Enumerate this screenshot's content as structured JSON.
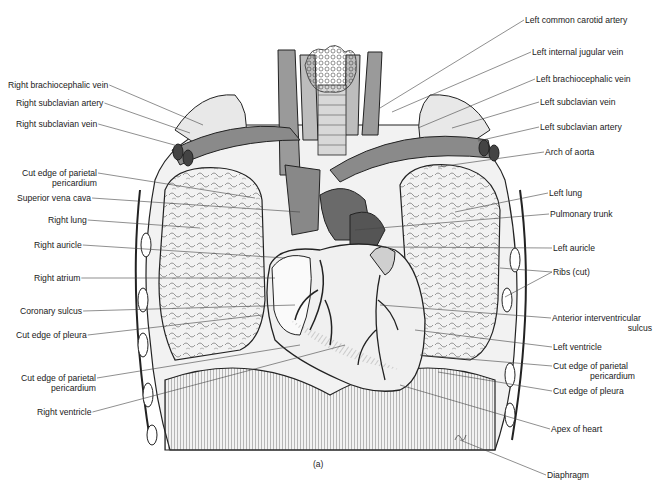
{
  "figure": {
    "caption": "(a)",
    "labels_left": [
      {
        "id": "right-brachiocephalic-vein",
        "text": "Right brachiocephalic vein",
        "x": 8,
        "y": 85,
        "tx": 203,
        "ty": 125
      },
      {
        "id": "right-subclavian-artery",
        "text": "Right subclavian artery",
        "x": 16,
        "y": 103,
        "tx": 190,
        "ty": 133
      },
      {
        "id": "right-subclavian-vein",
        "text": "Right subclavian vein",
        "x": 16,
        "y": 124,
        "tx": 178,
        "ty": 146
      },
      {
        "id": "cut-edge-parietal-pericardium-upper",
        "line1": "Cut edge of parietal",
        "line2": "pericardium",
        "x": 17,
        "y": 171,
        "tx": 255,
        "ty": 198
      },
      {
        "id": "superior-vena-cava",
        "text": "Superior vena cava",
        "x": 17,
        "y": 197,
        "tx": 300,
        "ty": 212
      },
      {
        "id": "right-lung",
        "text": "Right lung",
        "x": 48,
        "y": 219,
        "tx": 200,
        "ty": 228
      },
      {
        "id": "right-auricle",
        "text": "Right auricle",
        "x": 34,
        "y": 243,
        "tx": 285,
        "ty": 258
      },
      {
        "id": "right-atrium",
        "text": "Right atrium",
        "x": 34,
        "y": 272,
        "tx": 275,
        "ty": 278
      },
      {
        "id": "coronary-sulcus",
        "text": "Coronary sulcus",
        "x": 20,
        "y": 306,
        "tx": 295,
        "ty": 305
      },
      {
        "id": "cut-edge-pleura-left-side",
        "text": "Cut edge of pleura",
        "x": 16,
        "y": 330,
        "tx": 262,
        "ty": 315
      },
      {
        "id": "cut-edge-parietal-pericardium-lower",
        "line1": "Cut edge of parietal",
        "line2": "pericardium",
        "x": 16,
        "y": 372,
        "tx": 300,
        "ty": 345
      },
      {
        "id": "right-ventricle",
        "text": "Right ventricle",
        "x": 37,
        "y": 407,
        "tx": 345,
        "ty": 345
      }
    ],
    "labels_right": [
      {
        "id": "left-common-carotid-artery",
        "text": "Left common carotid artery",
        "x": 525,
        "y": 17,
        "tx": 380,
        "ty": 108
      },
      {
        "id": "left-internal-jugular-vein",
        "text": "Left internal jugular vein",
        "x": 532,
        "y": 49,
        "tx": 392,
        "ty": 112
      },
      {
        "id": "left-brachiocephalic-vein",
        "text": "Left brachiocephalic vein",
        "x": 536,
        "y": 76,
        "tx": 418,
        "ty": 128
      },
      {
        "id": "left-subclavian-vein",
        "text": "Left subclavian vein",
        "x": 540,
        "y": 98,
        "tx": 452,
        "ty": 128
      },
      {
        "id": "left-subclavian-artery",
        "text": "Left subclavian artery",
        "x": 540,
        "y": 124,
        "tx": 478,
        "ty": 141
      },
      {
        "id": "arch-of-aorta",
        "text": "Arch of aorta",
        "x": 545,
        "y": 150,
        "tx": 438,
        "ty": 167
      },
      {
        "id": "left-lung",
        "text": "Left lung",
        "x": 549,
        "y": 190,
        "tx": 455,
        "ty": 212
      },
      {
        "id": "pulmonary-trunk",
        "text": "Pulmonary trunk",
        "x": 550,
        "y": 210,
        "tx": 355,
        "ty": 230
      },
      {
        "id": "left-auricle",
        "text": "Left auricle",
        "x": 553,
        "y": 243,
        "tx": 385,
        "ty": 247
      },
      {
        "id": "ribs-cut",
        "text": "Ribs (cut)",
        "x": 553,
        "y": 268,
        "tx": 500,
        "ty": 268,
        "tx2": 505,
        "ty2": 297
      },
      {
        "id": "anterior-interventricular-sulcus",
        "line1": "Anterior interventricular",
        "line2": "sulcus",
        "x": 552,
        "y": 315,
        "tx": 380,
        "ty": 305
      },
      {
        "id": "left-ventricle",
        "text": "Left ventricle",
        "x": 553,
        "y": 343,
        "tx": 415,
        "ty": 330
      },
      {
        "id": "cut-edge-parietal-pericardium-right",
        "line1": "Cut edge of parietal",
        "line2": "pericardium",
        "x": 553,
        "y": 363,
        "tx": 420,
        "ty": 355
      },
      {
        "id": "cut-edge-pleura-right-side",
        "text": "Cut edge of pleura",
        "x": 553,
        "y": 388,
        "tx": 438,
        "ty": 372
      },
      {
        "id": "apex-of-heart",
        "text": "Apex of heart",
        "x": 551,
        "y": 425,
        "tx": 400,
        "ty": 385
      },
      {
        "id": "diaphragm",
        "text": "Diaphragm",
        "x": 547,
        "y": 472,
        "tx": 460,
        "ty": 440
      }
    ]
  }
}
